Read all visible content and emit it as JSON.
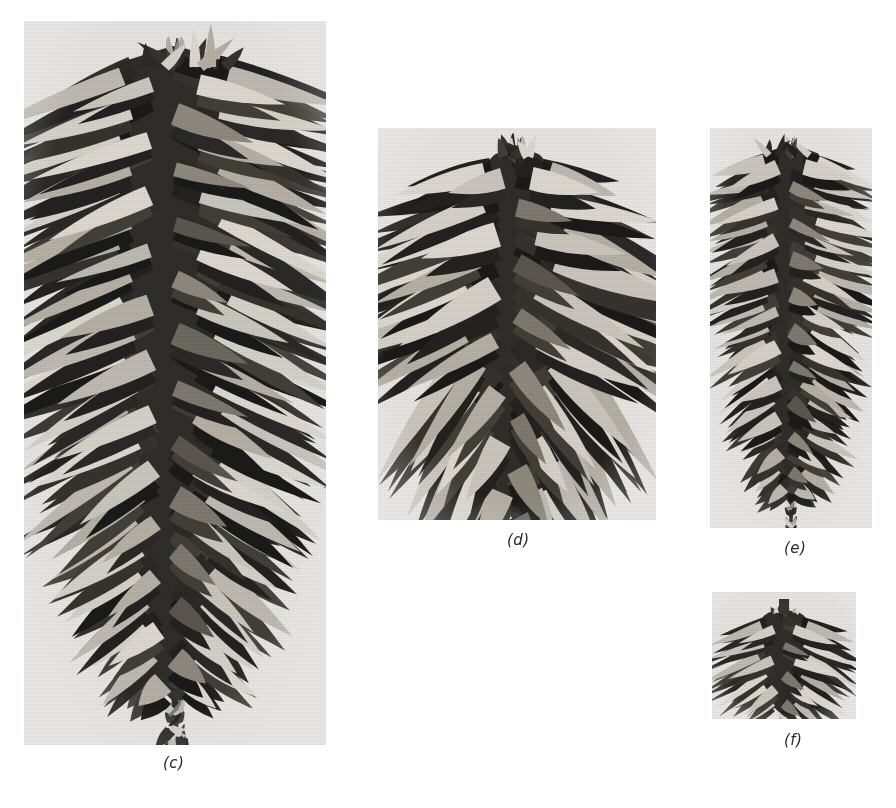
{
  "figure": {
    "type": "botanical-photo-plate",
    "background_color": "#ffffff",
    "photo_paper_color": "#e9e8e4",
    "ink_color": "#2b2b2b"
  },
  "panels": [
    {
      "id": "c",
      "caption": "(c)",
      "alt": "Very long narrow pine cone, cylindrical, many thin recurved scales",
      "x": 24,
      "y": 21,
      "w": 302,
      "h": 724,
      "caption_x": 163,
      "caption_y": 754,
      "cone": {
        "shape": "long-cylindrical",
        "rows": 26,
        "scales_per_row": 7,
        "tip": "top",
        "cx_ratio": 0.5,
        "top_ratio": 0.035,
        "bottom_ratio": 0.985,
        "max_width_ratio": 0.86,
        "seed": 11
      }
    },
    {
      "id": "d",
      "caption": "(d)",
      "alt": "Broad ovoid pine cone with thick woody spreading scales",
      "x": 378,
      "y": 128,
      "w": 278,
      "h": 392,
      "caption_x": 507,
      "caption_y": 531,
      "cone": {
        "shape": "broad-ovoid",
        "rows": 15,
        "scales_per_row": 8,
        "tip": "top",
        "cx_ratio": 0.5,
        "top_ratio": 0.045,
        "bottom_ratio": 0.98,
        "max_width_ratio": 0.92,
        "seed": 27
      }
    },
    {
      "id": "e",
      "caption": "(e)",
      "alt": "Slender elongated pine cone, narrow cylindrical with tight scales",
      "x": 710,
      "y": 128,
      "w": 162,
      "h": 400,
      "caption_x": 784,
      "caption_y": 539,
      "cone": {
        "shape": "slender-cylindrical",
        "rows": 22,
        "scales_per_row": 6,
        "tip": "top",
        "cx_ratio": 0.5,
        "top_ratio": 0.04,
        "bottom_ratio": 0.985,
        "max_width_ratio": 0.8,
        "seed": 43
      }
    },
    {
      "id": "f",
      "caption": "(f)",
      "alt": "Small squat rounded pine cone with short stalk",
      "x": 712,
      "y": 592,
      "w": 144,
      "h": 127,
      "caption_x": 784,
      "caption_y": 731,
      "cone": {
        "shape": "small-squat",
        "rows": 8,
        "scales_per_row": 7,
        "tip": "top",
        "cx_ratio": 0.5,
        "top_ratio": 0.14,
        "bottom_ratio": 0.97,
        "max_width_ratio": 0.8,
        "seed": 77
      }
    }
  ]
}
